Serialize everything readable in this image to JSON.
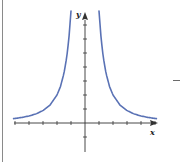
{
  "chart_data": {
    "type": "line",
    "title": "",
    "xlabel": "x",
    "ylabel": "y",
    "function": "y = k / x^2 (k ≈ 8)",
    "xlim": [
      -5,
      5
    ],
    "ylim": [
      -1.5,
      8
    ],
    "x_ticks": [
      -5,
      -4,
      -3,
      -2,
      -1,
      1,
      2,
      3,
      4,
      5
    ],
    "y_ticks": [
      -1,
      1,
      2,
      3,
      4,
      5,
      6,
      7
    ],
    "tick_labels_shown": false,
    "grid": false,
    "legend": null,
    "series": [
      {
        "name": "curve",
        "color": "#5a72b5",
        "branches": [
          {
            "x": [
              -5.1,
              -4.5,
              -4,
              -3.5,
              -3,
              -2.5,
              -2,
              -1.75,
              -1.5,
              -1.3,
              -1.15,
              -1.0
            ],
            "y": [
              0.31,
              0.4,
              0.5,
              0.65,
              0.89,
              1.28,
              2.0,
              2.61,
              3.56,
              4.73,
              6.05,
              8.0
            ]
          },
          {
            "x": [
              1.0,
              1.15,
              1.3,
              1.5,
              1.75,
              2,
              2.5,
              3,
              3.5,
              4,
              4.5,
              5.1
            ],
            "y": [
              8.0,
              6.05,
              4.73,
              3.56,
              2.61,
              2.0,
              1.28,
              0.89,
              0.65,
              0.5,
              0.4,
              0.31
            ]
          }
        ]
      }
    ]
  },
  "labels": {
    "x_axis": "x",
    "y_axis": "y"
  },
  "style": {
    "curve_color": "#5a72b5",
    "axis_color": "#333333"
  }
}
